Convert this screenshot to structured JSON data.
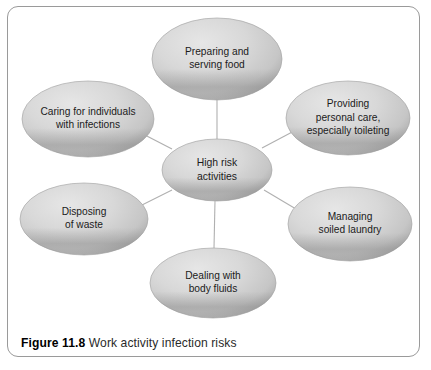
{
  "figure": {
    "caption_number": "Figure 11.8",
    "caption_text": "Work activity infection risks",
    "frame_border_color": "#9a9a9a",
    "background_color": "#ffffff"
  },
  "diagram": {
    "type": "hub-and-spoke",
    "connector_color": "#b0b0b0",
    "node_fill_light": "#dedede",
    "node_fill_mid": "#cfcfcf",
    "node_fill_dark": "#9d9d9d",
    "node_text_color": "#1b1b1b",
    "center": {
      "id": "high-risk-activities",
      "lines": [
        "High risk",
        "activities"
      ],
      "cx": 217,
      "cy": 170,
      "rx": 55,
      "ry": 31
    },
    "nodes": [
      {
        "id": "preparing-serving-food",
        "lines": [
          "Preparing and",
          "serving food"
        ],
        "cx": 217,
        "cy": 59,
        "rx": 65,
        "ry": 41
      },
      {
        "id": "providing-personal-care",
        "lines": [
          "Providing",
          "personal care,",
          "especially toileting"
        ],
        "cx": 348,
        "cy": 118,
        "rx": 62,
        "ry": 37
      },
      {
        "id": "managing-soiled-laundry",
        "lines": [
          "Managing",
          "soiled laundry"
        ],
        "cx": 350,
        "cy": 224,
        "rx": 62,
        "ry": 37
      },
      {
        "id": "dealing-with-body-fluids",
        "lines": [
          "Dealing with",
          "body fluids"
        ],
        "cx": 213,
        "cy": 283,
        "rx": 63,
        "ry": 35
      },
      {
        "id": "disposing-of-waste",
        "lines": [
          "Disposing",
          "of waste"
        ],
        "cx": 84,
        "cy": 219,
        "rx": 64,
        "ry": 36
      },
      {
        "id": "caring-for-individuals-with-infections",
        "lines": [
          "Caring for individuals",
          "with infections"
        ],
        "cx": 88,
        "cy": 119,
        "rx": 66,
        "ry": 38
      }
    ],
    "connectors": [
      {
        "id": "center-to-preparing-serving-food",
        "x1": 217,
        "y1": 139,
        "x2": 217,
        "y2": 100
      },
      {
        "id": "center-to-providing-personal-care",
        "x1": 262,
        "y1": 148,
        "x2": 296,
        "y2": 130
      },
      {
        "id": "center-to-managing-soiled-laundry",
        "x1": 264,
        "y1": 190,
        "x2": 296,
        "y2": 209
      },
      {
        "id": "center-to-dealing-with-body-fluids",
        "x1": 215,
        "y1": 201,
        "x2": 214,
        "y2": 248
      },
      {
        "id": "center-to-disposing-of-waste",
        "x1": 172,
        "y1": 190,
        "x2": 140,
        "y2": 206
      },
      {
        "id": "center-to-caring-for-individuals",
        "x1": 172,
        "y1": 149,
        "x2": 141,
        "y2": 133
      }
    ]
  }
}
